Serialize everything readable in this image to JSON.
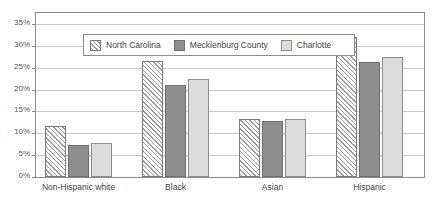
{
  "chart_data": {
    "type": "bar",
    "title": "",
    "subtitle": "",
    "xlabel": "",
    "ylabel": "",
    "categories": [
      "Non-Hispanic white",
      "Black",
      "Asian",
      "Hispanic"
    ],
    "series": [
      {
        "name": "North Carolina",
        "values": [
          11.6,
          26.6,
          13.2,
          32.0
        ],
        "pattern": "diagonal-hatch",
        "color": "#e9e9e9"
      },
      {
        "name": "Mecklenburg County",
        "values": [
          7.3,
          21.1,
          12.8,
          26.3
        ],
        "pattern": "solid",
        "color": "#8f8f8f"
      },
      {
        "name": "Charlotte",
        "values": [
          7.8,
          22.3,
          13.3,
          27.5
        ],
        "pattern": "solid",
        "color": "#dcdcdc"
      }
    ],
    "ylim": [
      0,
      37.5
    ],
    "yticks": [
      0,
      5,
      10,
      15,
      20,
      25,
      30,
      35
    ],
    "ytick_labels": [
      "0%",
      "5%",
      "10%",
      "15%",
      "20%",
      "25%",
      "30%",
      "35%"
    ],
    "grid": true,
    "legend_position": "top-left-inside",
    "annotations": []
  },
  "legend": {
    "items": [
      {
        "label": "North Carolina",
        "swatch": "hatched-swatch"
      },
      {
        "label": "Mecklenburg County",
        "swatch": "dark-gray-swatch"
      },
      {
        "label": "Charlotte",
        "swatch": "light-gray-swatch"
      }
    ]
  }
}
